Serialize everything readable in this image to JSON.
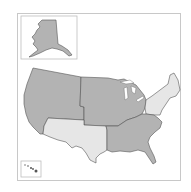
{
  "map": {
    "title": "United States regions map",
    "colors": {
      "dark_region": "#b3b3b3",
      "light_region": "#e6e6e6",
      "border": "#555555",
      "frame": "#c8c8c8",
      "background": "#ffffff"
    },
    "regions": [
      {
        "id": "west",
        "name": "West",
        "shade": "dark"
      },
      {
        "id": "midwest",
        "name": "Midwest",
        "shade": "dark"
      },
      {
        "id": "southwest",
        "name": "Southwest",
        "shade": "light"
      },
      {
        "id": "southeast",
        "name": "Southeast",
        "shade": "dark"
      },
      {
        "id": "northeast",
        "name": "Northeast",
        "shade": "light"
      }
    ],
    "insets": [
      {
        "id": "alaska",
        "name": "Alaska",
        "shade": "dark"
      },
      {
        "id": "hawaii",
        "name": "Hawaii",
        "shade": "dark"
      }
    ]
  }
}
